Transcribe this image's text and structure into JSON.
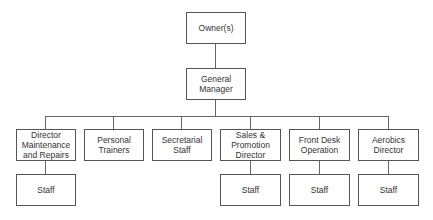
{
  "chart": {
    "root": {
      "label": "Owner(s)"
    },
    "manager": {
      "label": "General\nManager"
    },
    "departments": [
      {
        "label": "Director\nMaintenance\nand Repairs",
        "staff": "Staff"
      },
      {
        "label": "Personal\nTrainers",
        "staff": null
      },
      {
        "label": "Secretarial\nStaff",
        "staff": null
      },
      {
        "label": "Sales &\nPromotion\nDirector",
        "staff": "Staff"
      },
      {
        "label": "Front Desk\nOperation",
        "staff": "Staff"
      },
      {
        "label": "Aerobics\nDirector",
        "staff": "Staff"
      }
    ]
  }
}
